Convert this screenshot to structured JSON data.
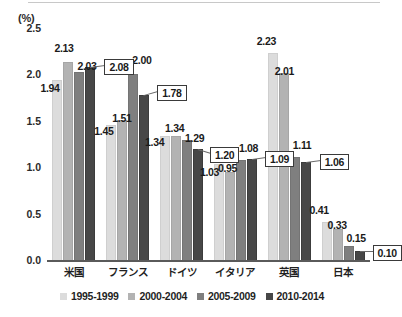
{
  "chart_data": {
    "type": "bar",
    "title": "",
    "subtitle": "",
    "xlabel": "",
    "ylabel": "(%)",
    "unit_label": "(%)",
    "ylim": [
      0,
      2.5
    ],
    "ytick_labels": [
      "0.0",
      "0.5",
      "1.0",
      "1.5",
      "2.0",
      "2.5"
    ],
    "ytick_values": [
      0,
      0.5,
      1.0,
      1.5,
      2.0,
      2.5
    ],
    "grid": false,
    "legend_position": "bottom",
    "categories": [
      "米国",
      "フランス",
      "ドイツ",
      "イタリア",
      "英国",
      "日本"
    ],
    "series": [
      {
        "name": "1995-1999",
        "color": "#dcdcdc",
        "values": [
          1.94,
          1.45,
          1.34,
          1.03,
          2.23,
          0.41
        ],
        "labels": [
          "1.94",
          "1.45",
          "1.34",
          "1.03",
          "2.23",
          "0.41"
        ],
        "boxed": [
          false,
          false,
          false,
          false,
          false,
          false
        ]
      },
      {
        "name": "2000-2004",
        "color": "#b3b3b3",
        "values": [
          2.13,
          1.51,
          1.34,
          0.95,
          2.01,
          0.33
        ],
        "labels": [
          "2.13",
          "1.51",
          "1.34",
          "0.95",
          "2.01",
          "0.33"
        ],
        "boxed": [
          false,
          false,
          false,
          false,
          false,
          false
        ]
      },
      {
        "name": "2005-2009",
        "color": "#7f7f7f",
        "values": [
          2.03,
          2.0,
          1.29,
          1.08,
          1.11,
          0.15
        ],
        "labels": [
          "2.03",
          "2.00",
          "1.29",
          "1.08",
          "1.11",
          "0.15"
        ],
        "boxed": [
          false,
          false,
          false,
          false,
          false,
          false
        ]
      },
      {
        "name": "2010-2014",
        "color": "#474747",
        "values": [
          2.08,
          1.78,
          1.2,
          1.09,
          1.06,
          0.1
        ],
        "labels": [
          "2.08",
          "1.78",
          "1.20",
          "1.09",
          "1.06",
          "0.10"
        ],
        "boxed": [
          true,
          true,
          true,
          true,
          true,
          true
        ]
      }
    ]
  },
  "legend": {
    "items": [
      {
        "label": "1995-1999",
        "color": "#dcdcdc"
      },
      {
        "label": "2000-2004",
        "color": "#b3b3b3"
      },
      {
        "label": "2005-2009",
        "color": "#7f7f7f"
      },
      {
        "label": "2010-2014",
        "color": "#474747"
      }
    ]
  }
}
